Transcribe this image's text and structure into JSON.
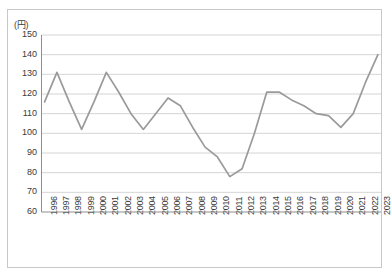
{
  "chart_data": {
    "type": "line",
    "title": "",
    "xlabel": "",
    "ylabel": "(円)",
    "unit_label": "(円)",
    "ylim": [
      60,
      150
    ],
    "ytick_step": 10,
    "yticks": [
      150,
      140,
      130,
      120,
      110,
      100,
      90,
      80,
      70,
      60
    ],
    "grid": true,
    "legend": false,
    "line_color": "#9a9a9a",
    "categories": [
      "1996",
      "1997",
      "1998",
      "1999",
      "2000",
      "2001",
      "2002",
      "2003",
      "2004",
      "2005",
      "2006",
      "2007",
      "2008",
      "2009",
      "2010",
      "2011",
      "2012",
      "2013",
      "2014",
      "2015",
      "2016",
      "2017",
      "2018",
      "2019",
      "2020",
      "2021",
      "2022",
      "2023"
    ],
    "values": [
      116,
      131,
      116,
      102,
      116,
      131,
      121,
      110,
      102,
      110,
      118,
      114,
      103,
      93,
      88,
      78,
      82,
      100,
      121,
      121,
      117,
      114,
      110,
      109,
      103,
      110,
      126,
      140
    ]
  }
}
